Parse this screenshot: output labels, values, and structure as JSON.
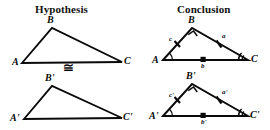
{
  "headers": {
    "left": "Hypothesis",
    "right": "Conclusion"
  },
  "symbols": {
    "congruent": "≅"
  },
  "hypothesis": {
    "triangle_top": {
      "vertices": [
        {
          "name": "A",
          "label": "A",
          "x": 22,
          "y": 63
        },
        {
          "name": "B",
          "label": "B",
          "x": 52,
          "y": 28
        },
        {
          "name": "C",
          "label": "C",
          "x": 122,
          "y": 62
        }
      ]
    },
    "triangle_bottom": {
      "vertices": [
        {
          "name": "A-prime",
          "label": "A'",
          "x": 24,
          "y": 119
        },
        {
          "name": "B-prime",
          "label": "B'",
          "x": 52,
          "y": 86
        },
        {
          "name": "C-prime",
          "label": "C'",
          "x": 122,
          "y": 118
        }
      ]
    }
  },
  "conclusion": {
    "triangle_top": {
      "vertices": [
        {
          "name": "A",
          "label": "A",
          "x": 163,
          "y": 60
        },
        {
          "name": "B",
          "label": "B",
          "x": 192,
          "y": 28
        },
        {
          "name": "C",
          "label": "C",
          "x": 248,
          "y": 60
        }
      ],
      "sides": [
        {
          "name": "side-a",
          "label": "a",
          "x": 222,
          "y": 36,
          "ticks": 1
        },
        {
          "name": "side-b",
          "label": "b",
          "x": 203,
          "y": 64,
          "ticks": 1
        },
        {
          "name": "side-c",
          "label": "c",
          "x": 170,
          "y": 39,
          "ticks": 1
        }
      ],
      "angles": [
        {
          "name": "angle-A",
          "arcs": 1
        },
        {
          "name": "angle-B",
          "right_angle": true
        },
        {
          "name": "angle-C",
          "arcs": 2
        }
      ]
    },
    "triangle_bottom": {
      "vertices": [
        {
          "name": "A-prime",
          "label": "A'",
          "x": 163,
          "y": 116
        },
        {
          "name": "B-prime",
          "label": "B'",
          "x": 192,
          "y": 84
        },
        {
          "name": "C-prime",
          "label": "C'",
          "x": 248,
          "y": 116
        }
      ],
      "sides": [
        {
          "name": "side-a-prime",
          "label": "a'",
          "x": 222,
          "y": 92,
          "ticks": 1
        },
        {
          "name": "side-b-prime",
          "label": "b'",
          "x": 203,
          "y": 120,
          "ticks": 1
        },
        {
          "name": "side-c-prime",
          "label": "c'",
          "x": 170,
          "y": 95,
          "ticks": 1
        }
      ],
      "angles": [
        {
          "name": "angle-A-prime",
          "arcs": 1
        },
        {
          "name": "angle-B-prime",
          "right_angle": true
        },
        {
          "name": "angle-C-prime",
          "arcs": 2
        }
      ]
    }
  },
  "style": {
    "stroke": "#0a0a0a",
    "background": "#ffffff"
  }
}
